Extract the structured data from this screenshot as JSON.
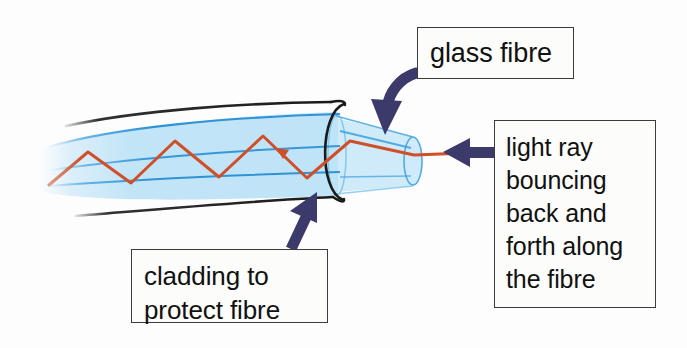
{
  "diagram": {
    "colors": {
      "arrow_navy": "#3b3a6b",
      "ray_orange": "#d0522a",
      "core_blue": "#3399dd",
      "cladding_fill": "#bfe3f7",
      "outline_black": "#1a1a1a",
      "box_border": "#3b3b3b",
      "text": "#111111",
      "background": "#ffffff"
    },
    "callouts": [
      {
        "id": "glass-fibre",
        "lines": [
          "glass fibre"
        ],
        "pointer": "curved-arrow-down-left"
      },
      {
        "id": "light-ray",
        "lines": [
          "light ray",
          "bouncing",
          "back and",
          "forth along",
          "the fibre"
        ],
        "pointer": "straight-arrow-left"
      },
      {
        "id": "cladding",
        "lines": [
          "cladding to",
          "protect fibre"
        ],
        "pointer": "straight-arrow-up-right"
      }
    ],
    "parts": {
      "fibre_body_label": "glass fibre core and cladding",
      "light_ray_label": "orange zig-zag light ray",
      "outer_sheath_label": "black outer cladding lines",
      "end_ring_label": "fibre cross-section ring"
    }
  }
}
